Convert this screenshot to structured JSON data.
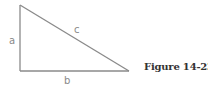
{
  "figure": {
    "caption": "Figure 14-23",
    "shape": "right-triangle",
    "labels": {
      "a": "a",
      "b": "b",
      "c": "c"
    },
    "line_color": "#8a8a8a"
  }
}
